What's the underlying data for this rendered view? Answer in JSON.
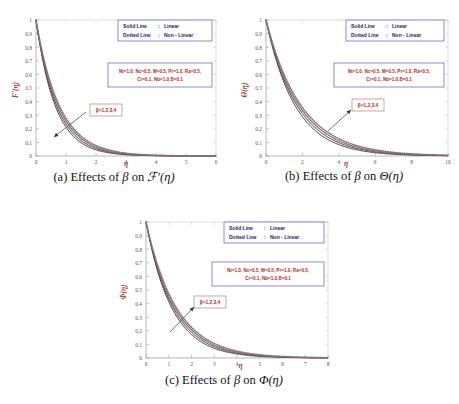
{
  "figure": {
    "panel_count": 3,
    "legend": {
      "rows": [
        {
          "style_label": "Solid Line",
          "sep": ":",
          "meaning": "Linear"
        },
        {
          "style_label": "Dotted Line",
          "sep": ":",
          "meaning": "Non - Linear"
        }
      ]
    },
    "parameters": {
      "line1": "Nt=1.0, Nc=0.5, M=0.5, Pr=1.0, Ra=0.5,",
      "line2": "Cr=0.1, Nb=1.0,B=0.1"
    },
    "beta_annotation": "β=1,2,3,4",
    "colors": {
      "axis_title": "#a33b3b",
      "legend_border": "#5b5bbf",
      "legend_text": "#1d1d5e",
      "param_text": "#b02a2a",
      "solid_curve": "#3b3b3b",
      "dotted_curve": "#8b6f6f",
      "arrow": "#30304d"
    }
  },
  "panels": [
    {
      "id": "a",
      "caption_prefix": "(a)",
      "caption_text": "Effects of",
      "caption_symbol": "β",
      "caption_on": "on",
      "caption_target": "ℱ′(η)",
      "arrow_direction": "down-left"
    },
    {
      "id": "b",
      "caption_prefix": "(b)",
      "caption_text": "Effects of",
      "caption_symbol": "β",
      "caption_on": "on",
      "caption_target": "Θ(η)",
      "arrow_direction": "up-right"
    },
    {
      "id": "c",
      "caption_prefix": "(c)",
      "caption_text": "Effects of",
      "caption_symbol": "β",
      "caption_on": "on",
      "caption_target": "Φ(η)",
      "arrow_direction": "up-right"
    }
  ],
  "chart_data": [
    {
      "type": "line",
      "panel": "a",
      "title": "",
      "xlabel": "η",
      "ylabel": "F'(η)",
      "xlim": [
        0,
        6
      ],
      "ylim": [
        0,
        1
      ],
      "xticks": [
        0,
        1,
        2,
        3,
        4,
        5,
        6
      ],
      "xticklabels": [
        "0",
        "1",
        "2",
        "3",
        "4",
        "5",
        "6"
      ],
      "yticks": [
        0,
        0.1,
        0.2,
        0.3,
        0.4,
        0.5,
        0.6,
        0.7,
        0.8,
        0.9,
        1
      ],
      "yticklabels": [
        "0",
        "0.1",
        "0.2",
        "0.3",
        "0.4",
        "0.5",
        "0.6",
        "0.7",
        "0.8",
        "0.9",
        "1"
      ],
      "grid": false,
      "legend_position": "top-right",
      "annotation": "β=1,2,3,4",
      "decay_rates": [
        1.55,
        1.45,
        1.36,
        1.28
      ],
      "series": [
        {
          "name": "β=1 (Linear)",
          "style": "solid",
          "x": [
            0,
            0.25,
            0.5,
            0.75,
            1,
            1.25,
            1.5,
            1.75,
            2,
            2.5,
            3,
            3.5,
            4,
            4.5,
            5,
            5.5,
            6
          ],
          "values": [
            1,
            0.678,
            0.46,
            0.312,
            0.212,
            0.144,
            0.098,
            0.066,
            0.045,
            0.021,
            0.0095,
            0.0044,
            0.002,
            0.0009,
            0.0004,
            0.0002,
            0.0001
          ]
        },
        {
          "name": "β=2 (Linear)",
          "style": "solid",
          "x": [
            0,
            0.25,
            0.5,
            0.75,
            1,
            1.25,
            1.5,
            1.75,
            2,
            2.5,
            3,
            3.5,
            4,
            4.5,
            5,
            5.5,
            6
          ],
          "values": [
            1,
            0.696,
            0.485,
            0.337,
            0.235,
            0.163,
            0.114,
            0.079,
            0.055,
            0.027,
            0.013,
            0.0063,
            0.0031,
            0.0015,
            0.0007,
            0.0004,
            0.0002
          ]
        },
        {
          "name": "β=3 (Non-Linear)",
          "style": "dotted",
          "x": [
            0,
            0.25,
            0.5,
            0.75,
            1,
            1.25,
            1.5,
            1.75,
            2,
            2.5,
            3,
            3.5,
            4,
            4.5,
            5,
            5.5,
            6
          ],
          "values": [
            1,
            0.712,
            0.507,
            0.361,
            0.257,
            0.183,
            0.13,
            0.093,
            0.066,
            0.033,
            0.017,
            0.0085,
            0.0043,
            0.0022,
            0.0011,
            0.0005,
            0.0003
          ]
        },
        {
          "name": "β=4 (Non-Linear)",
          "style": "dotted",
          "x": [
            0,
            0.25,
            0.5,
            0.75,
            1,
            1.25,
            1.5,
            1.75,
            2,
            2.5,
            3,
            3.5,
            4,
            4.5,
            5,
            5.5,
            6
          ],
          "values": [
            1,
            0.726,
            0.527,
            0.383,
            0.278,
            0.202,
            0.146,
            0.106,
            0.077,
            0.041,
            0.021,
            0.011,
            0.0059,
            0.0031,
            0.0017,
            0.0009,
            0.0005
          ]
        }
      ]
    },
    {
      "type": "line",
      "panel": "b",
      "title": "",
      "xlabel": "η",
      "ylabel": "Θ(η)",
      "xlim": [
        0,
        10
      ],
      "ylim": [
        0,
        1
      ],
      "xticks": [
        0,
        2,
        4,
        6,
        8,
        10
      ],
      "xticklabels": [
        "0",
        "2",
        "4",
        "6",
        "8",
        "10"
      ],
      "yticks": [
        0,
        0.1,
        0.2,
        0.3,
        0.4,
        0.5,
        0.6,
        0.7,
        0.8,
        0.9,
        1
      ],
      "yticklabels": [
        "0",
        "0.1",
        "0.2",
        "0.3",
        "0.4",
        "0.5",
        "0.6",
        "0.7",
        "0.8",
        "0.9",
        "1"
      ],
      "grid": false,
      "legend_position": "top-right",
      "annotation": "β=1,2,3,4",
      "decay_rates": [
        0.62,
        0.58,
        0.545,
        0.515
      ],
      "series": [
        {
          "name": "β=1 (Linear)",
          "style": "solid",
          "x": [
            0,
            0.5,
            1,
            1.5,
            2,
            2.5,
            3,
            3.5,
            4,
            5,
            6,
            7,
            8,
            9,
            10
          ],
          "values": [
            1,
            0.733,
            0.538,
            0.394,
            0.289,
            0.212,
            0.155,
            0.114,
            0.084,
            0.045,
            0.024,
            0.013,
            0.007,
            0.0038,
            0.002
          ]
        },
        {
          "name": "β=2 (Linear)",
          "style": "solid",
          "x": [
            0,
            0.5,
            1,
            1.5,
            2,
            2.5,
            3,
            3.5,
            4,
            5,
            6,
            7,
            8,
            9,
            10
          ],
          "values": [
            1,
            0.748,
            0.559,
            0.419,
            0.313,
            0.234,
            0.175,
            0.131,
            0.098,
            0.055,
            0.031,
            0.017,
            0.0096,
            0.0054,
            0.003
          ]
        },
        {
          "name": "β=3 (Non-Linear)",
          "style": "dotted",
          "x": [
            0,
            0.5,
            1,
            1.5,
            2,
            2.5,
            3,
            3.5,
            4,
            5,
            6,
            7,
            8,
            9,
            10
          ],
          "values": [
            1,
            0.761,
            0.579,
            0.441,
            0.335,
            0.255,
            0.194,
            0.148,
            0.112,
            0.065,
            0.038,
            0.022,
            0.013,
            0.0074,
            0.0043
          ]
        },
        {
          "name": "β=4 (Non-Linear)",
          "style": "dotted",
          "x": [
            0,
            0.5,
            1,
            1.5,
            2,
            2.5,
            3,
            3.5,
            4,
            5,
            6,
            7,
            8,
            9,
            10
          ],
          "values": [
            1,
            0.773,
            0.598,
            0.462,
            0.357,
            0.276,
            0.213,
            0.165,
            0.128,
            0.076,
            0.046,
            0.027,
            0.016,
            0.0098,
            0.0059
          ]
        }
      ]
    },
    {
      "type": "line",
      "panel": "c",
      "title": "",
      "xlabel": "η",
      "ylabel": "Φ(η)",
      "xlim": [
        0,
        8
      ],
      "ylim": [
        0,
        1
      ],
      "xticks": [
        0,
        1,
        2,
        3,
        4,
        5,
        6,
        7,
        8
      ],
      "xticklabels": [
        "0",
        "1",
        "2",
        "3",
        "4",
        "5",
        "6",
        "7",
        "8"
      ],
      "yticks": [
        0,
        0.1,
        0.2,
        0.3,
        0.4,
        0.5,
        0.6,
        0.7,
        0.8,
        0.9,
        1
      ],
      "yticklabels": [
        "0",
        "0.1",
        "0.2",
        "0.3",
        "0.4",
        "0.5",
        "0.6",
        "0.7",
        "0.8",
        "0.9",
        "1"
      ],
      "grid": false,
      "legend_position": "top-right",
      "annotation": "β=1,2,3,4",
      "decay_rates": [
        0.88,
        0.83,
        0.785,
        0.745
      ],
      "series": [
        {
          "name": "β=1 (Linear)",
          "style": "solid",
          "x": [
            0,
            0.5,
            1,
            1.5,
            2,
            2.5,
            3,
            3.5,
            4,
            5,
            6,
            7,
            8
          ],
          "values": [
            1,
            0.644,
            0.415,
            0.267,
            0.172,
            0.111,
            0.071,
            0.046,
            0.03,
            0.012,
            0.005,
            0.002,
            0.0009
          ]
        },
        {
          "name": "β=2 (Linear)",
          "style": "solid",
          "x": [
            0,
            0.5,
            1,
            1.5,
            2,
            2.5,
            3,
            3.5,
            4,
            5,
            6,
            7,
            8
          ],
          "values": [
            1,
            0.66,
            0.436,
            0.288,
            0.19,
            0.126,
            0.083,
            0.055,
            0.036,
            0.016,
            0.007,
            0.003,
            0.0013
          ]
        },
        {
          "name": "β=3 (Non-Linear)",
          "style": "dotted",
          "x": [
            0,
            0.5,
            1,
            1.5,
            2,
            2.5,
            3,
            3.5,
            4,
            5,
            6,
            7,
            8
          ],
          "values": [
            1,
            0.675,
            0.456,
            0.308,
            0.208,
            0.14,
            0.095,
            0.064,
            0.043,
            0.02,
            0.009,
            0.004,
            0.0019
          ]
        },
        {
          "name": "β=4 (Non-Linear)",
          "style": "dotted",
          "x": [
            0,
            0.5,
            1,
            1.5,
            2,
            2.5,
            3,
            3.5,
            4,
            5,
            6,
            7,
            8
          ],
          "values": [
            1,
            0.689,
            0.475,
            0.327,
            0.226,
            0.155,
            0.107,
            0.074,
            0.051,
            0.024,
            0.011,
            0.005,
            0.0025
          ]
        }
      ]
    }
  ]
}
